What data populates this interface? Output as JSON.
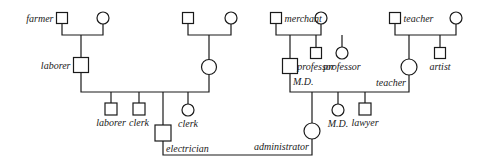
{
  "diagram": {
    "type": "pedigree",
    "colors": {
      "ink": "#1a1a1a",
      "background": "#ffffff"
    },
    "people": [
      {
        "id": "farmer",
        "sex": "male",
        "label": "farmer"
      },
      {
        "id": "farmer-wife",
        "sex": "female",
        "label": ""
      },
      {
        "id": "laborer-father",
        "sex": "male",
        "label": "laborer"
      },
      {
        "id": "gp2-male",
        "sex": "male",
        "label": ""
      },
      {
        "id": "gp2-female",
        "sex": "female",
        "label": ""
      },
      {
        "id": "mother-1",
        "sex": "female",
        "label": ""
      },
      {
        "id": "child-laborer",
        "sex": "male",
        "label": "laborer"
      },
      {
        "id": "child-clerk-m",
        "sex": "male",
        "label": "clerk"
      },
      {
        "id": "electrician",
        "sex": "male",
        "label": "electrician"
      },
      {
        "id": "child-clerk-f",
        "sex": "female",
        "label": "clerk"
      },
      {
        "id": "merchant",
        "sex": "male",
        "label": "merchant"
      },
      {
        "id": "merchant-wife",
        "sex": "female",
        "label": ""
      },
      {
        "id": "md-father",
        "sex": "male",
        "label": "M.D."
      },
      {
        "id": "professor-m",
        "sex": "male",
        "label": "professor"
      },
      {
        "id": "professor-f",
        "sex": "female",
        "label": "professor"
      },
      {
        "id": "teacher",
        "sex": "male",
        "label": "teacher"
      },
      {
        "id": "teacher-wife",
        "sex": "female",
        "label": ""
      },
      {
        "id": "teacher-mother",
        "sex": "female",
        "label": "teacher"
      },
      {
        "id": "artist",
        "sex": "male",
        "label": "artist"
      },
      {
        "id": "administrator",
        "sex": "female",
        "label": "administrator"
      },
      {
        "id": "child-md",
        "sex": "female",
        "label": "M.D."
      },
      {
        "id": "lawyer",
        "sex": "male",
        "label": "lawyer"
      }
    ],
    "unions": [
      {
        "partners": [
          "farmer",
          "farmer-wife"
        ],
        "children": [
          "laborer-father"
        ]
      },
      {
        "partners": [
          "gp2-male",
          "gp2-female"
        ],
        "children": [
          "mother-1"
        ]
      },
      {
        "partners": [
          "laborer-father",
          "mother-1"
        ],
        "children": [
          "child-laborer",
          "child-clerk-m",
          "electrician",
          "child-clerk-f"
        ]
      },
      {
        "partners": [
          "merchant",
          "merchant-wife"
        ],
        "children": [
          "md-father",
          "professor-m",
          "professor-f"
        ]
      },
      {
        "partners": [
          "teacher",
          "teacher-wife"
        ],
        "children": [
          "teacher-mother",
          "artist"
        ]
      },
      {
        "partners": [
          "md-father",
          "teacher-mother"
        ],
        "children": [
          "administrator",
          "child-md",
          "lawyer"
        ]
      },
      {
        "partners": [
          "electrician",
          "administrator"
        ],
        "children": []
      }
    ]
  }
}
